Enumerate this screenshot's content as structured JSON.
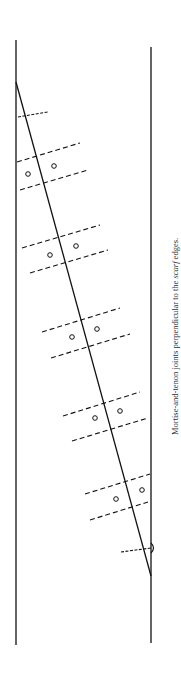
{
  "caption": {
    "prefix": "Mortise-and-tenon joints perpendicular to the ",
    "emph": "scarf",
    "suffix": " edges."
  },
  "diagram": {
    "left_edge": {
      "x": 16,
      "y1": 40,
      "y2": 645
    },
    "right_edge": {
      "x": 151,
      "y1": 47,
      "y2": 643
    },
    "scarf_line": {
      "x1": 16,
      "y1": 82,
      "x2": 151,
      "y2": 576
    },
    "joints": 5,
    "stroke_color": "#111111"
  }
}
